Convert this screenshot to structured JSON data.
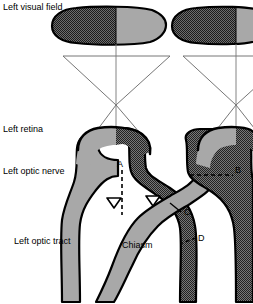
{
  "figure": {
    "width": 253,
    "height": 304
  },
  "labels": {
    "visual_field": "Left visual field",
    "retina": "Left retina",
    "optic_nerve": "Left optic nerve",
    "optic_tract": "Left optic tract",
    "chiasm": "Chiasm"
  },
  "lesion_markers": {
    "a": "A",
    "b": "B",
    "c": "C",
    "d": "D"
  },
  "colors": {
    "outline": "#000000",
    "light_gray_fill": "#a8a8a8",
    "dark_hatch_fill": "#4a4a4a",
    "white_fill": "#ffffff",
    "ray_line": "#555555",
    "background": "#ffffff"
  },
  "structures": {
    "left_eye_field_half_dark": "temporal (dark checkered) half of left visual field ellipse",
    "left_eye_field_half_light": "nasal (light gray) half of left visual field ellipse",
    "right_eye_field_half_dark": "temporal (dark checkered) half of right visual field ellipse",
    "right_eye_field_half_light": "nasal (light gray) half of right visual field ellipse"
  }
}
